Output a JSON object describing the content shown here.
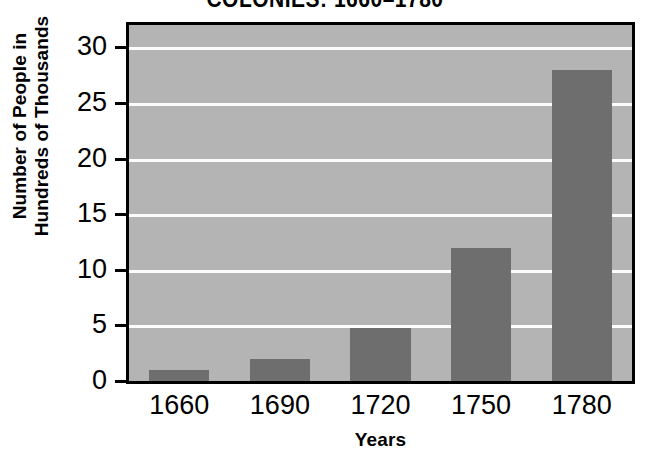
{
  "chart_data": {
    "type": "bar",
    "title": "COLONIES: 1660–1780",
    "xlabel": "Years",
    "ylabel": "Number of People in Hundreds of Thousands",
    "ylabel_line1": "Number of People in",
    "ylabel_line2": "Hundreds of Thousands",
    "categories": [
      "1660",
      "1690",
      "1720",
      "1750",
      "1780"
    ],
    "values": [
      1,
      2,
      4.8,
      12,
      28
    ],
    "ylim": [
      0,
      32
    ],
    "yticks": [
      0,
      5,
      10,
      15,
      20,
      25,
      30
    ],
    "ytick_labels": [
      "0",
      "5",
      "10",
      "15",
      "20",
      "25",
      "30"
    ],
    "gridlines": [
      5,
      10,
      15,
      20,
      25,
      30
    ],
    "grid": true,
    "grid_color": "#fdfdfd",
    "legend": null,
    "bar_color": "#6e6e6e",
    "plot_background": "#b4b4b4",
    "frame_color": "#000000",
    "page_background": "#ffffff"
  }
}
